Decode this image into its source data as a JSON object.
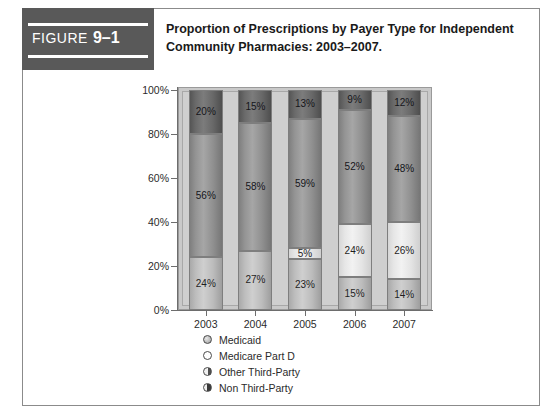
{
  "figure": {
    "label": "FIGURE",
    "number": "9–1",
    "title": "Proportion of Prescriptions by Payer Type for Independent Community Pharmacies: 2003–2007."
  },
  "chart_data": {
    "type": "bar",
    "subtype": "stacked-100-percent",
    "title": "Proportion of Prescriptions by Payer Type for Independent Community Pharmacies: 2003–2007.",
    "xlabel": "",
    "ylabel": "",
    "ylim": [
      0,
      100
    ],
    "ytick_labels": [
      "0%",
      "20%",
      "40%",
      "60%",
      "80%",
      "100%"
    ],
    "ytick_values": [
      0,
      20,
      40,
      60,
      80,
      100
    ],
    "grid": false,
    "legend_position": "bottom-left",
    "categories": [
      "2003",
      "2004",
      "2005",
      "2006",
      "2007"
    ],
    "series": [
      {
        "name": "Medicaid",
        "marker": "medicaid-marker",
        "color": "#bdbdbd",
        "values": [
          24,
          27,
          23,
          15,
          14
        ],
        "labels": [
          "24%",
          "27%",
          "23%",
          "15%",
          "14%"
        ]
      },
      {
        "name": "Medicare Part D",
        "marker": "medicare-part-d-marker",
        "color": "#ececec",
        "values": [
          0,
          0,
          5,
          24,
          26
        ],
        "labels": [
          "",
          "",
          "5%",
          "24%",
          "26%"
        ]
      },
      {
        "name": "Other Third-Party",
        "marker": "other-third-party-marker",
        "color": "#9a9a9a",
        "values": [
          56,
          58,
          59,
          52,
          48
        ],
        "labels": [
          "56%",
          "58%",
          "59%",
          "52%",
          "48%"
        ]
      },
      {
        "name": "Non Third-Party",
        "marker": "non-third-party-marker",
        "color": "#6b6b6b",
        "values": [
          20,
          15,
          13,
          9,
          12
        ],
        "labels": [
          "20%",
          "15%",
          "13%",
          "9%",
          "12%"
        ]
      }
    ]
  }
}
